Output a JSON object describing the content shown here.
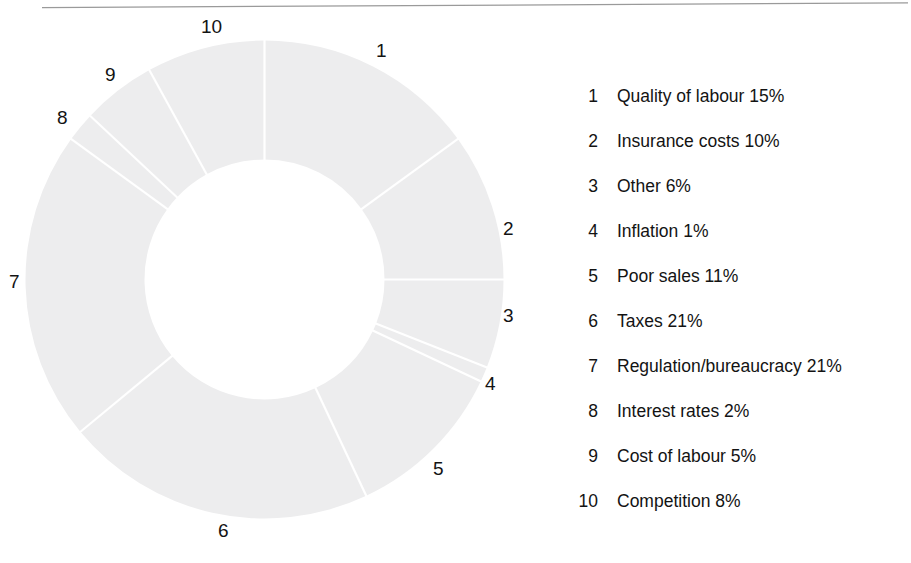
{
  "page": {
    "background_color": "#ffffff",
    "top_rule_color": "#9a9a9a"
  },
  "chart_data": {
    "type": "pie",
    "variant": "donut",
    "title": "",
    "subtitle": "",
    "xlabel": "",
    "ylabel": "",
    "units": "percent",
    "total": 100,
    "start_angle_deg": 0,
    "direction": "clockwise",
    "slice_fill_color": "#ededee",
    "slice_divider_color": "#ffffff",
    "label_color": "#131313",
    "legend_position": "right",
    "grid": false,
    "categories": [
      "Quality of labour",
      "Insurance costs",
      "Other",
      "Inflation",
      "Poor sales",
      "Taxes",
      "Regulation/bureaucracy",
      "Interest rates",
      "Cost of labour",
      "Competition"
    ],
    "values": [
      15,
      10,
      6,
      1,
      11,
      21,
      21,
      2,
      5,
      8
    ],
    "slice_keys": [
      "1",
      "2",
      "3",
      "4",
      "5",
      "6",
      "7",
      "8",
      "9",
      "10"
    ],
    "slices": [
      {
        "key": "1",
        "label": "Quality of labour",
        "value": 15,
        "value_text": "15%"
      },
      {
        "key": "2",
        "label": "Insurance costs",
        "value": 10,
        "value_text": "10%"
      },
      {
        "key": "3",
        "label": "Other",
        "value": 6,
        "value_text": "6%"
      },
      {
        "key": "4",
        "label": "Inflation",
        "value": 1,
        "value_text": "1%"
      },
      {
        "key": "5",
        "label": "Poor sales",
        "value": 11,
        "value_text": "11%"
      },
      {
        "key": "6",
        "label": "Taxes",
        "value": 21,
        "value_text": "21%"
      },
      {
        "key": "7",
        "label": "Regulation/bureaucracy",
        "value": 21,
        "value_text": "21%"
      },
      {
        "key": "8",
        "label": "Interest rates",
        "value": 2,
        "value_text": "2%"
      },
      {
        "key": "9",
        "label": "Cost of labour",
        "value": 5,
        "value_text": "5%"
      },
      {
        "key": "10",
        "label": "Competition",
        "value": 8,
        "value_text": "8%"
      }
    ]
  },
  "donut": {
    "callout_numbers": [
      {
        "key": "1",
        "text": "1",
        "x": 376,
        "y": 41
      },
      {
        "key": "2",
        "text": "2",
        "x": 503,
        "y": 219
      },
      {
        "key": "3",
        "text": "3",
        "x": 503,
        "y": 306
      },
      {
        "key": "4",
        "text": "4",
        "x": 485,
        "y": 374
      },
      {
        "key": "5",
        "text": "5",
        "x": 433,
        "y": 459
      },
      {
        "key": "6",
        "text": "6",
        "x": 218,
        "y": 521
      },
      {
        "key": "7",
        "text": "7",
        "x": 9,
        "y": 272
      },
      {
        "key": "8",
        "text": "8",
        "x": 57,
        "y": 108
      },
      {
        "key": "9",
        "text": "9",
        "x": 105,
        "y": 65
      },
      {
        "key": "10",
        "text": "10",
        "x": 201,
        "y": 17
      }
    ]
  },
  "legend": {
    "rows": [
      {
        "num": "1",
        "text": "Quality of labour 15%"
      },
      {
        "num": "2",
        "text": "Insurance costs 10%"
      },
      {
        "num": "3",
        "text": "Other 6%"
      },
      {
        "num": "4",
        "text": "Inflation 1%"
      },
      {
        "num": "5",
        "text": "Poor sales 11%"
      },
      {
        "num": "6",
        "text": "Taxes 21%"
      },
      {
        "num": "7",
        "text": "Regulation/bureaucracy 21%"
      },
      {
        "num": "8",
        "text": "Interest rates 2%"
      },
      {
        "num": "9",
        "text": "Cost of labour 5%"
      },
      {
        "num": "10",
        "text": "Competition 8%"
      }
    ]
  }
}
